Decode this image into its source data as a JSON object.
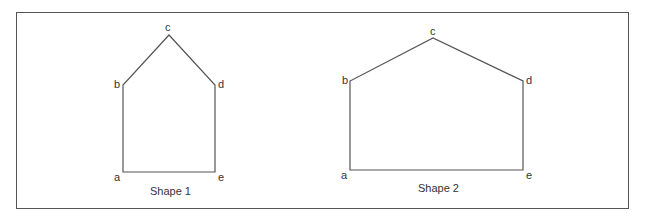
{
  "diagram": {
    "shapes": [
      {
        "caption": "Shape 1",
        "vertices": {
          "a": {
            "label": "a",
            "x": 123,
            "y": 172
          },
          "b": {
            "label": "b",
            "x": 123,
            "y": 85
          },
          "c": {
            "label": "c",
            "x": 169,
            "y": 35
          },
          "d": {
            "label": "d",
            "x": 215,
            "y": 85
          },
          "e": {
            "label": "e",
            "x": 215,
            "y": 172
          }
        }
      },
      {
        "caption": "Shape 2",
        "vertices": {
          "a": {
            "label": "a",
            "x": 350,
            "y": 170
          },
          "b": {
            "label": "b",
            "x": 350,
            "y": 81
          },
          "c": {
            "label": "c",
            "x": 433,
            "y": 38
          },
          "d": {
            "label": "d",
            "x": 523,
            "y": 81
          },
          "e": {
            "label": "e",
            "x": 523,
            "y": 170
          }
        }
      }
    ],
    "line_color": "#555555"
  }
}
